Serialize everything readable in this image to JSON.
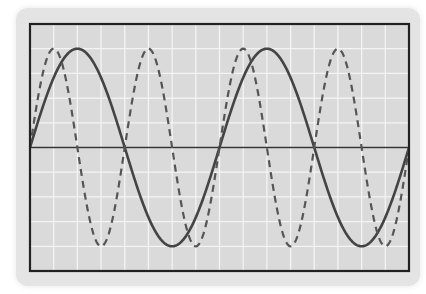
{
  "chart_data": {
    "type": "line",
    "title": "",
    "xlabel": "",
    "ylabel": "",
    "grid": true,
    "legend": null,
    "grid_columns": 16,
    "grid_rows": 10,
    "xlim": [
      0,
      16
    ],
    "ylim": [
      -5,
      5
    ],
    "series": [
      {
        "name": "solid-wave",
        "style": "solid",
        "function": "sine",
        "amplitude": 4,
        "period_grid_units": 8,
        "phase": 0,
        "color": "#444444"
      },
      {
        "name": "dashed-wave",
        "style": "dashed",
        "function": "sine",
        "amplitude": 4,
        "period_grid_units": 4,
        "phase": 0,
        "color": "#555555"
      }
    ]
  },
  "colors": {
    "page_bg": "#ffffff",
    "card_bg": "#e4e4e4",
    "plot_bg": "#dadada",
    "grid": "#f4f4f4",
    "border": "#222222",
    "axis": "#333333"
  }
}
